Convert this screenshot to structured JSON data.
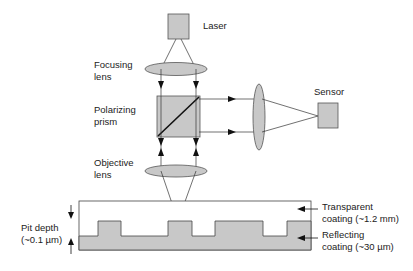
{
  "diagram": {
    "labels": {
      "laser": "Laser",
      "focusing_lens_1": "Focusing",
      "focusing_lens_2": "lens",
      "polarizing_prism_1": "Polarizing",
      "polarizing_prism_2": "prism",
      "objective_lens_1": "Objective",
      "objective_lens_2": "lens",
      "sensor": "Sensor",
      "pit_depth_1": "Pit depth",
      "pit_depth_2": "(~0.1 µm)",
      "transparent_coating_1": "Transparent",
      "transparent_coating_2": "coating (~1.2 mm)",
      "reflecting_coating_1": "Reflecting",
      "reflecting_coating_2": "coating (~30 µm)"
    },
    "colors": {
      "component_fill": "#c8c8c8",
      "line": "#222222",
      "background": "#ffffff"
    }
  }
}
